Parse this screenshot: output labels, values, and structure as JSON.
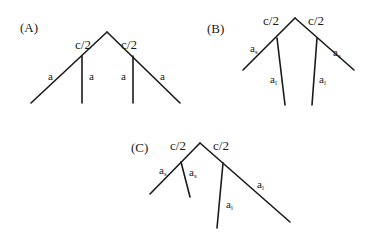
{
  "figure": {
    "panels": [
      {
        "id": "A",
        "label": "(A)",
        "half_left": "c/2",
        "half_right": "c/2",
        "edges": [
          {
            "base": "a",
            "sub": ""
          },
          {
            "base": "a",
            "sub": ""
          },
          {
            "base": "a",
            "sub": ""
          },
          {
            "base": "a",
            "sub": ""
          }
        ]
      },
      {
        "id": "B",
        "label": "(B)",
        "half_left": "c/2",
        "half_right": "c/2",
        "edges": [
          {
            "base": "a",
            "sub": "s"
          },
          {
            "base": "a",
            "sub": "l"
          },
          {
            "base": "a",
            "sub": "l"
          },
          {
            "base": "a",
            "sub": "s"
          }
        ]
      },
      {
        "id": "C",
        "label": "(C)",
        "half_left": "c/2",
        "half_right": "c/2",
        "edges": [
          {
            "base": "a",
            "sub": "s"
          },
          {
            "base": "a",
            "sub": "s"
          },
          {
            "base": "a",
            "sub": "l"
          },
          {
            "base": "a",
            "sub": "l"
          }
        ]
      }
    ],
    "colors": {
      "stroke": "#1a1a1a",
      "background": "#ffffff"
    }
  }
}
